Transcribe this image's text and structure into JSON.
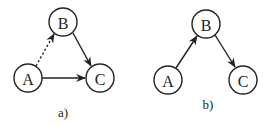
{
  "diagrams": [
    {
      "caption": "a)",
      "nodes": [
        {
          "id": "A",
          "label": "A",
          "cx": 28,
          "cy": 78
        },
        {
          "id": "B",
          "label": "B",
          "cx": 63,
          "cy": 22
        },
        {
          "id": "C",
          "label": "C",
          "cx": 100,
          "cy": 78
        }
      ],
      "edges": [
        {
          "from": "A",
          "to": "B",
          "style": "dotted"
        },
        {
          "from": "B",
          "to": "C",
          "style": "solid"
        },
        {
          "from": "A",
          "to": "C",
          "style": "solid"
        }
      ]
    },
    {
      "caption": "b)",
      "nodes": [
        {
          "id": "A",
          "label": "A",
          "cx": 168,
          "cy": 80
        },
        {
          "id": "B",
          "label": "B",
          "cx": 206,
          "cy": 24
        },
        {
          "id": "C",
          "label": "C",
          "cx": 243,
          "cy": 80
        }
      ],
      "edges": [
        {
          "from": "A",
          "to": "B",
          "style": "solid"
        },
        {
          "from": "B",
          "to": "C",
          "style": "solid"
        }
      ]
    }
  ],
  "colors": {
    "stroke": "#222222",
    "background": "#ffffff"
  }
}
